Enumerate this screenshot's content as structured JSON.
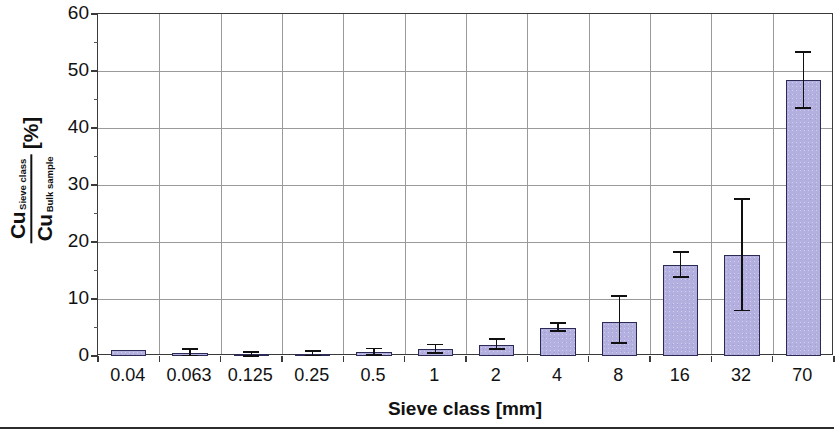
{
  "chart_data": {
    "type": "bar",
    "title": "",
    "xlabel": "Sieve class [mm]",
    "ylabel_numerator": "Cu",
    "ylabel_numerator_sub": "Sieve class",
    "ylabel_denominator": "Cu",
    "ylabel_denominator_sub": "Bulk sample",
    "ylabel_units": "[%]",
    "categories": [
      "0.04",
      "0.063",
      "0.125",
      "0.25",
      "0.5",
      "1",
      "2",
      "4",
      "8",
      "16",
      "32",
      "70"
    ],
    "values": [
      1.0,
      0.5,
      0.3,
      0.4,
      0.7,
      1.2,
      2.0,
      5.0,
      6.0,
      16.0,
      17.7,
      48.5
    ],
    "error_low": [
      1.0,
      0.1,
      0.0,
      0.1,
      0.2,
      0.5,
      1.2,
      4.4,
      2.3,
      13.8,
      8.0,
      43.5
    ],
    "error_high": [
      1.0,
      1.2,
      0.7,
      0.9,
      1.3,
      2.0,
      3.0,
      5.8,
      10.5,
      18.3,
      27.6,
      53.4
    ],
    "ylim": [
      0,
      60
    ],
    "yticks": [
      0,
      10,
      20,
      30,
      40,
      50,
      60
    ],
    "ytick_labels": [
      "0",
      "10",
      "20",
      "30",
      "40",
      "50",
      "60"
    ],
    "yminor_step": 5,
    "grid": true,
    "legend": "none",
    "bar_fill_color": "#b3b0e0",
    "bar_edge_color": "#2a2a55",
    "grid_color": "#9a9a9a",
    "axis_color": "#3a3a3a",
    "error_bar_color": "#101010"
  }
}
